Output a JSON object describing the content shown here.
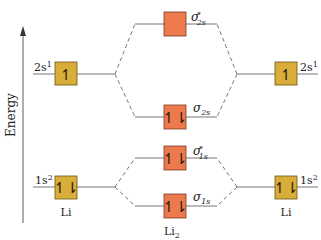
{
  "colors": {
    "atomic_box": "#d8ad3a",
    "atomic_box_border": "#6b5418",
    "molecular_box": "#ec7a4d",
    "molecular_box_border": "#7a3a22",
    "line": "#777777",
    "text": "#222222"
  },
  "axis": {
    "label": "Energy"
  },
  "left_atom": {
    "label": "Li",
    "orbitals": [
      {
        "name": "2s",
        "sup": "1",
        "electrons": "↿",
        "level": "2s"
      },
      {
        "name": "1s",
        "sup": "2",
        "electrons": "↿⇂",
        "level": "1s"
      }
    ]
  },
  "right_atom": {
    "label": "Li",
    "orbitals": [
      {
        "name": "2s",
        "sup": "1",
        "electrons": "↿",
        "level": "2s"
      },
      {
        "name": "1s",
        "sup": "2",
        "electrons": "↿⇂",
        "level": "1s"
      }
    ]
  },
  "molecule": {
    "label": "Li",
    "label_sub": "2",
    "orbitals": [
      {
        "symbol": "σ",
        "sup": "*",
        "sub": "2s",
        "electrons": "",
        "type": "antibonding"
      },
      {
        "symbol": "σ",
        "sup": "",
        "sub": "2s",
        "electrons": "↿⇂",
        "type": "bonding"
      },
      {
        "symbol": "σ",
        "sup": "*",
        "sub": "1s",
        "electrons": "↿⇂",
        "type": "antibonding"
      },
      {
        "symbol": "σ",
        "sup": "",
        "sub": "1s",
        "electrons": "↿⇂",
        "type": "bonding"
      }
    ]
  }
}
